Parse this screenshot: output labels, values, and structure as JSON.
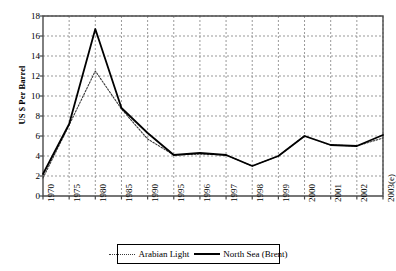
{
  "chart_data": {
    "type": "line",
    "title": "",
    "xlabel": "",
    "ylabel": "US $ Per Barrel",
    "ylim": [
      0,
      18
    ],
    "yticks": [
      0,
      2,
      4,
      6,
      8,
      10,
      12,
      14,
      16,
      18
    ],
    "categories": [
      "1970",
      "1975",
      "1980",
      "1985",
      "1990",
      "1995",
      "1996",
      "1997",
      "1998",
      "1999",
      "2000",
      "2001",
      "2002",
      "2003(e)"
    ],
    "grid": true,
    "legend_position": "bottom",
    "series": [
      {
        "name": "Arabian Light",
        "style": "dotted",
        "color": "#3a3a3a",
        "values": [
          1.8,
          7.1,
          12.5,
          8.7,
          5.7,
          4.1,
          4.2,
          4.1,
          3.0,
          4.0,
          6.0,
          5.1,
          5.0,
          5.8
        ]
      },
      {
        "name": "North Sea (Brent)",
        "style": "solid",
        "color": "#000000",
        "values": [
          2.2,
          7.2,
          16.7,
          8.8,
          6.3,
          4.1,
          4.3,
          4.1,
          3.0,
          4.0,
          6.0,
          5.1,
          5.0,
          6.1
        ]
      }
    ]
  },
  "legend": {
    "items": [
      {
        "label": "Arabian Light"
      },
      {
        "label": "North Sea (Brent)"
      }
    ]
  },
  "axes": {
    "y_title": "US $ Per Barrel",
    "y_labels": [
      "18",
      "16",
      "14",
      "12",
      "10",
      "8",
      "6",
      "4",
      "2",
      "0"
    ],
    "x_labels": [
      "1970",
      "1975",
      "1980",
      "1985",
      "1990",
      "1995",
      "1996",
      "1997",
      "1998",
      "1999",
      "2000",
      "2001",
      "2002",
      "2003(e)"
    ]
  },
  "colors": {
    "plot_border": "#4a4a4a",
    "grid": "#999999",
    "series_solid": "#000000",
    "series_dotted": "#3a3a3a",
    "background": "#ffffff"
  }
}
